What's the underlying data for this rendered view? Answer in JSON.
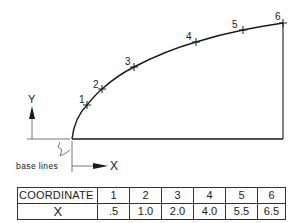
{
  "diagram": {
    "axis_labels": {
      "y": "Y",
      "x": "X"
    },
    "annotation": "base lines",
    "points": [
      {
        "label": "1",
        "x": 87,
        "y": 105
      },
      {
        "label": "2",
        "x": 102,
        "y": 89
      },
      {
        "label": "3",
        "x": 134,
        "y": 67
      },
      {
        "label": "4",
        "x": 196,
        "y": 42
      },
      {
        "label": "5",
        "x": 243,
        "y": 30
      },
      {
        "label": "6",
        "x": 283,
        "y": 23
      }
    ],
    "line_color": "#1a1a1a"
  },
  "table": {
    "header": [
      "COORDINATE",
      "1",
      "2",
      "3",
      "4",
      "5",
      "6"
    ],
    "rows": [
      [
        "X",
        ".5",
        "1.0",
        "2.0",
        "4.0",
        "5.5",
        "6.5"
      ]
    ]
  }
}
